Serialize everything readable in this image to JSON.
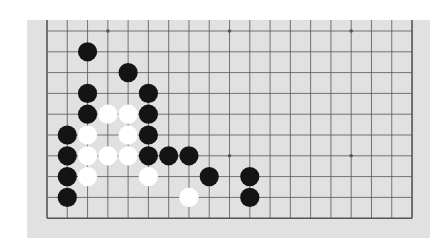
{
  "board": {
    "columns": 19,
    "rows_visible": 10,
    "origin_x": 20,
    "origin_y": 11,
    "cell_w": 20.28,
    "cell_h": 20.8,
    "stone_radius": 9.6,
    "edges": {
      "left": true,
      "right": true,
      "bottom": true,
      "top": false
    },
    "colors": {
      "background": "#e1e1e1",
      "line": "#555555",
      "black": "#141414",
      "white": "#ffffff"
    },
    "star_points": [
      [
        3,
        0
      ],
      [
        9,
        0
      ],
      [
        15,
        0
      ],
      [
        3,
        6
      ],
      [
        9,
        6
      ],
      [
        15,
        6
      ]
    ],
    "stones": [
      {
        "color": "black",
        "col": 2,
        "row": 1
      },
      {
        "color": "black",
        "col": 4,
        "row": 2
      },
      {
        "color": "black",
        "col": 2,
        "row": 3
      },
      {
        "color": "black",
        "col": 5,
        "row": 3
      },
      {
        "color": "black",
        "col": 2,
        "row": 4
      },
      {
        "color": "white",
        "col": 3,
        "row": 4
      },
      {
        "color": "white",
        "col": 4,
        "row": 4
      },
      {
        "color": "black",
        "col": 5,
        "row": 4
      },
      {
        "color": "black",
        "col": 1,
        "row": 5
      },
      {
        "color": "white",
        "col": 2,
        "row": 5
      },
      {
        "color": "white",
        "col": 4,
        "row": 5
      },
      {
        "color": "black",
        "col": 5,
        "row": 5
      },
      {
        "color": "black",
        "col": 1,
        "row": 6
      },
      {
        "color": "white",
        "col": 2,
        "row": 6
      },
      {
        "color": "white",
        "col": 3,
        "row": 6
      },
      {
        "color": "white",
        "col": 4,
        "row": 6
      },
      {
        "color": "black",
        "col": 5,
        "row": 6
      },
      {
        "color": "black",
        "col": 6,
        "row": 6
      },
      {
        "color": "black",
        "col": 7,
        "row": 6
      },
      {
        "color": "black",
        "col": 1,
        "row": 7
      },
      {
        "color": "white",
        "col": 2,
        "row": 7
      },
      {
        "color": "white",
        "col": 5,
        "row": 7
      },
      {
        "color": "black",
        "col": 8,
        "row": 7
      },
      {
        "color": "black",
        "col": 10,
        "row": 7
      },
      {
        "color": "black",
        "col": 1,
        "row": 8
      },
      {
        "color": "white",
        "col": 7,
        "row": 8
      },
      {
        "color": "black",
        "col": 10,
        "row": 8
      }
    ]
  }
}
